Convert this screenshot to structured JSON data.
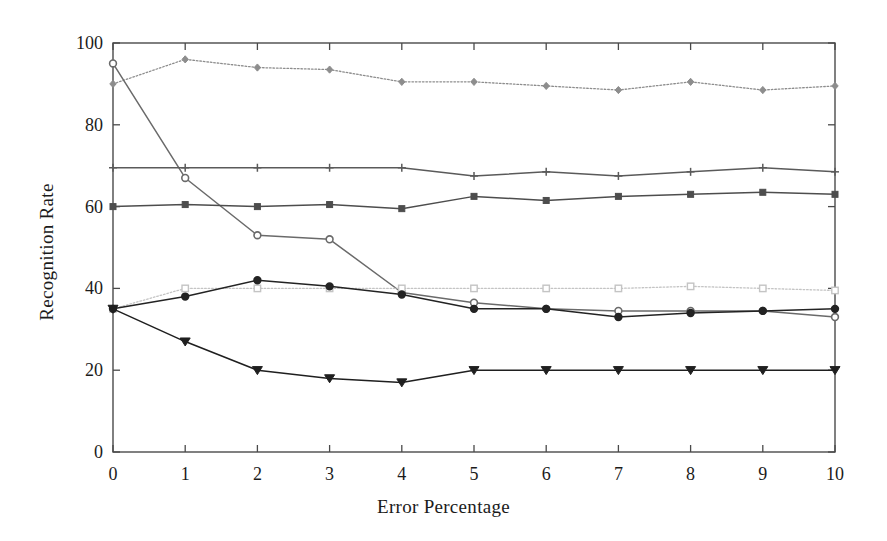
{
  "chart_data": {
    "type": "line",
    "title": "",
    "xlabel": "Error Percentage",
    "ylabel": "Recognition Rate",
    "xlim": [
      0,
      10
    ],
    "ylim": [
      0,
      100
    ],
    "xticks": [
      0,
      1,
      2,
      3,
      4,
      5,
      6,
      7,
      8,
      9,
      10
    ],
    "yticks": [
      0,
      20,
      40,
      60,
      80,
      100
    ],
    "grid": false,
    "legend": "none",
    "x": [
      0,
      1,
      2,
      3,
      4,
      5,
      6,
      7,
      8,
      9,
      10
    ],
    "series": [
      {
        "name": "series-top-dotted",
        "marker": "diamond",
        "linestyle": "dotted",
        "color": "#8d8d8d",
        "values": [
          90,
          96,
          94,
          93.5,
          90.5,
          90.5,
          89.5,
          88.5,
          90.5,
          88.5,
          89.5
        ]
      },
      {
        "name": "series-steep-decline",
        "marker": "circle",
        "linestyle": "solid",
        "color": "#6a6a6a",
        "values": [
          95,
          67,
          53,
          52,
          39,
          36.5,
          35,
          34.5,
          34.5,
          34.5,
          33
        ]
      },
      {
        "name": "series-flat-70",
        "marker": "plus",
        "linestyle": "solid",
        "color": "#5a5a5a",
        "values": [
          69.5,
          69.5,
          69.5,
          69.5,
          69.5,
          67.5,
          68.5,
          67.5,
          68.5,
          69.5,
          68.5
        ]
      },
      {
        "name": "series-flat-60",
        "marker": "square",
        "linestyle": "solid",
        "color": "#4d4d4d",
        "values": [
          60,
          60.5,
          60,
          60.5,
          59.5,
          62.5,
          61.5,
          62.5,
          63,
          63.5,
          63
        ]
      },
      {
        "name": "series-light-squares-40",
        "marker": "square-open",
        "linestyle": "dotted",
        "color": "#c4c4c4",
        "values": [
          35,
          40,
          40,
          40,
          40,
          40,
          40,
          40,
          40.5,
          40,
          39.5
        ]
      },
      {
        "name": "series-dark-circles-35",
        "marker": "circle-filled",
        "linestyle": "solid",
        "color": "#232323",
        "values": [
          35,
          38,
          42,
          40.5,
          38.5,
          35,
          35,
          33,
          34,
          34.5,
          35
        ]
      },
      {
        "name": "series-triangles-20",
        "marker": "triangle-down",
        "linestyle": "solid",
        "color": "#1f1f1f",
        "values": [
          35,
          27,
          20,
          18,
          17,
          20,
          20,
          20,
          20,
          20,
          20
        ]
      }
    ]
  },
  "axes": {
    "x_title": "Error Percentage",
    "y_title": "Recognition Rate",
    "x_tick_labels": [
      "0",
      "1",
      "2",
      "3",
      "4",
      "5",
      "6",
      "7",
      "8",
      "9",
      "10"
    ],
    "y_tick_labels": [
      "0",
      "20",
      "40",
      "60",
      "80",
      "100"
    ]
  },
  "style": {
    "frame_color": "#4a4a4a",
    "background": "#ffffff",
    "text_color": "#1b1b1b"
  }
}
